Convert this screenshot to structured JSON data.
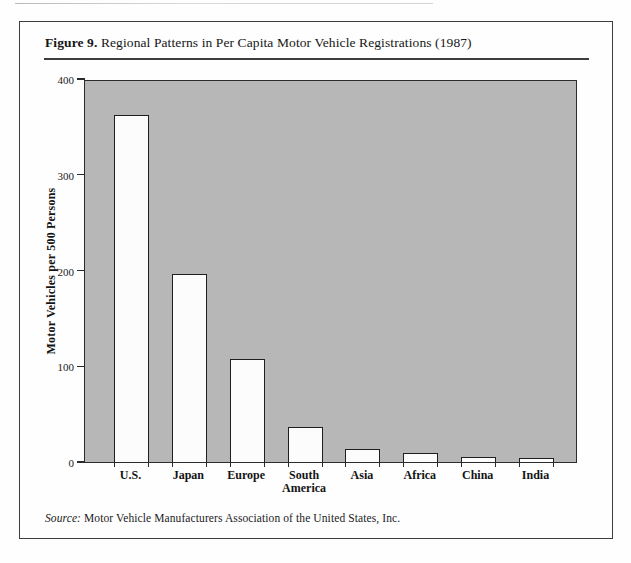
{
  "figure": {
    "label": "Figure 9.",
    "title": "Regional Patterns in Per Capita Motor Vehicle Registrations (1987)"
  },
  "source": {
    "label": "Source:",
    "text": "Motor Vehicle Manufacturers Association of the United States, Inc."
  },
  "chart_data": {
    "type": "bar",
    "title": "Figure 9. Regional Patterns in Per Capita Motor Vehicle Registrations (1987)",
    "categories": [
      "U.S.",
      "Japan",
      "Europe",
      "South\nAmerica",
      "Asia",
      "Africa",
      "China",
      "India"
    ],
    "values": [
      362,
      196,
      108,
      37,
      14,
      9,
      5,
      4
    ],
    "xlabel": "",
    "ylabel": "Motor Vehicles per 500 Persons",
    "ylim": [
      0,
      400
    ],
    "yticks": [
      0,
      100,
      200,
      300,
      400
    ],
    "grid": false,
    "legend": "none",
    "bar_fill": "#fcfcfc",
    "bar_border": "#1e1e1e",
    "plot_bg": "#b7b7b7",
    "axis_color": "#2b2b2b"
  }
}
